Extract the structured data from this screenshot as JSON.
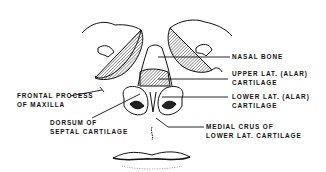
{
  "diagram": {
    "labels": [
      {
        "id": "nasal-bone",
        "lines": [
          "NASAL BONE"
        ]
      },
      {
        "id": "upper-lat-cartilage",
        "lines": [
          "UPPER LAT. (ALAR)",
          "CARTILAGE"
        ]
      },
      {
        "id": "lower-lat-cartilage",
        "lines": [
          "LOWER LAT. (ALAR)",
          "CARTILAGE"
        ]
      },
      {
        "id": "medial-crus",
        "lines": [
          "MEDIAL CRUS OF",
          "LOWER LAT. CARTILAGE"
        ]
      },
      {
        "id": "frontal-process",
        "lines": [
          "FRONTAL PROCESS",
          "OF MAXILLA"
        ]
      },
      {
        "id": "dorsum-septal",
        "lines": [
          "DORSUM OF",
          "SEPTAL CARTILAGE"
        ]
      }
    ],
    "colors": {
      "ink": "#111111",
      "background": "#ffffff"
    }
  }
}
